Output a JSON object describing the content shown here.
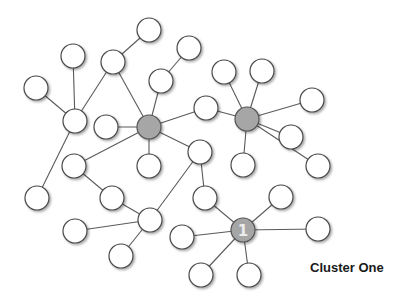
{
  "caption": "Cluster One",
  "colors": {
    "hub_fill": "#a6a6a6",
    "node_fill": "#ffffff",
    "edge": "#5a5a5a"
  },
  "node_radius": 12,
  "nodes": [
    {
      "id": "n0",
      "x": 149,
      "y": 30
    },
    {
      "id": "n1",
      "x": 73,
      "y": 56
    },
    {
      "id": "n2",
      "x": 113,
      "y": 62
    },
    {
      "id": "n3",
      "x": 189,
      "y": 48
    },
    {
      "id": "n4",
      "x": 36,
      "y": 88
    },
    {
      "id": "n5",
      "x": 161,
      "y": 81
    },
    {
      "id": "n6",
      "x": 75,
      "y": 121
    },
    {
      "id": "n7",
      "x": 106,
      "y": 127
    },
    {
      "id": "hub1",
      "x": 149,
      "y": 127,
      "hub": true
    },
    {
      "id": "n9",
      "x": 206,
      "y": 108
    },
    {
      "id": "n10",
      "x": 224,
      "y": 72
    },
    {
      "id": "n11",
      "x": 262,
      "y": 71
    },
    {
      "id": "hub2",
      "x": 247,
      "y": 119,
      "hub": true
    },
    {
      "id": "n13",
      "x": 312,
      "y": 100
    },
    {
      "id": "n14",
      "x": 291,
      "y": 137
    },
    {
      "id": "n15",
      "x": 200,
      "y": 152
    },
    {
      "id": "n16",
      "x": 74,
      "y": 166
    },
    {
      "id": "n17",
      "x": 149,
      "y": 166
    },
    {
      "id": "n18",
      "x": 243,
      "y": 165
    },
    {
      "id": "n19",
      "x": 318,
      "y": 166
    },
    {
      "id": "n20",
      "x": 37,
      "y": 198
    },
    {
      "id": "n21",
      "x": 112,
      "y": 198
    },
    {
      "id": "n22",
      "x": 205,
      "y": 198
    },
    {
      "id": "n23",
      "x": 281,
      "y": 197
    },
    {
      "id": "n24",
      "x": 150,
      "y": 220
    },
    {
      "id": "n25",
      "x": 75,
      "y": 231
    },
    {
      "id": "n26",
      "x": 182,
      "y": 237
    },
    {
      "id": "hub3",
      "x": 243,
      "y": 230,
      "hub": true,
      "label": "1"
    },
    {
      "id": "n28",
      "x": 318,
      "y": 229
    },
    {
      "id": "n29",
      "x": 121,
      "y": 256
    },
    {
      "id": "n30",
      "x": 201,
      "y": 275
    },
    {
      "id": "n31",
      "x": 249,
      "y": 275
    }
  ],
  "edges": [
    [
      "n0",
      "n2"
    ],
    [
      "n1",
      "n6"
    ],
    [
      "n2",
      "n6"
    ],
    [
      "n2",
      "hub1"
    ],
    [
      "n4",
      "n6"
    ],
    [
      "n6",
      "n20"
    ],
    [
      "n3",
      "n5"
    ],
    [
      "n5",
      "hub1"
    ],
    [
      "n7",
      "hub1"
    ],
    [
      "hub1",
      "n9"
    ],
    [
      "hub1",
      "n17"
    ],
    [
      "hub1",
      "n16"
    ],
    [
      "hub1",
      "n15"
    ],
    [
      "n16",
      "n21"
    ],
    [
      "n21",
      "n24"
    ],
    [
      "n25",
      "n24"
    ],
    [
      "n29",
      "n24"
    ],
    [
      "n24",
      "n15"
    ],
    [
      "n15",
      "n22"
    ],
    [
      "n22",
      "hub3"
    ],
    [
      "n26",
      "hub3"
    ],
    [
      "n23",
      "hub3"
    ],
    [
      "n28",
      "hub3"
    ],
    [
      "n30",
      "hub3"
    ],
    [
      "n31",
      "hub3"
    ],
    [
      "hub2",
      "n10"
    ],
    [
      "hub2",
      "n11"
    ],
    [
      "hub2",
      "n13"
    ],
    [
      "hub2",
      "n14"
    ],
    [
      "hub2",
      "n18"
    ],
    [
      "hub2",
      "n19"
    ],
    [
      "hub2",
      "n9"
    ]
  ]
}
